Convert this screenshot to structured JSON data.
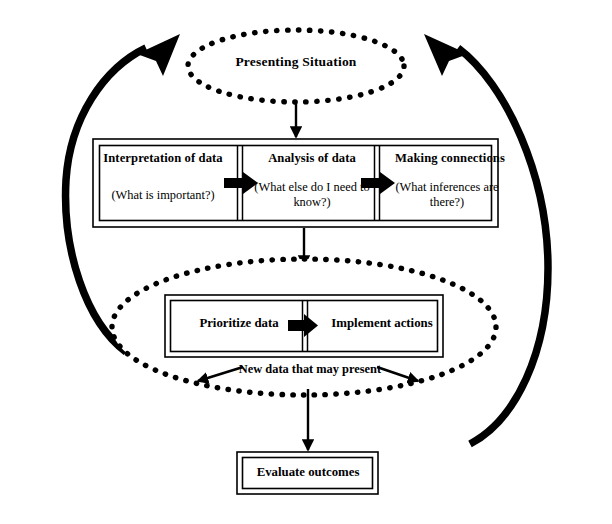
{
  "diagram": {
    "colors": {
      "stroke": "#000000",
      "background": "#ffffff",
      "fill": "#ffffff"
    },
    "top_node": {
      "shape": "dotted-ellipse",
      "label": "Presenting Situation"
    },
    "process_row": {
      "shape": "double-bordered-box-with-three-cells",
      "cells": [
        {
          "title": "Interpretation of data",
          "question": "(What is important?)"
        },
        {
          "title": "Analysis of data",
          "question": "(What else do I need to know?)"
        },
        {
          "title": "Making connections",
          "question": "(What inferences are there?)"
        }
      ],
      "connectors": [
        "block-arrow-right",
        "block-arrow-right"
      ]
    },
    "action_node": {
      "shape": "dotted-ellipse",
      "box": {
        "cells": [
          {
            "title": "Prioritize data"
          },
          {
            "title": "Implement actions"
          }
        ],
        "connector": "block-arrow-right"
      },
      "caption": "New data that may present",
      "caption_arrows": [
        "arrow-left",
        "arrow-right"
      ]
    },
    "outcome_node": {
      "shape": "double-bordered-box",
      "label": "Evaluate outcomes"
    },
    "flow_arrows": [
      {
        "name": "presenting-to-process",
        "direction": "down"
      },
      {
        "name": "process-to-action",
        "direction": "down"
      },
      {
        "name": "action-to-evaluate",
        "direction": "down"
      },
      {
        "name": "left-feedback-arc",
        "direction": "up-right"
      },
      {
        "name": "right-feedback-arc",
        "direction": "up-left"
      }
    ]
  }
}
